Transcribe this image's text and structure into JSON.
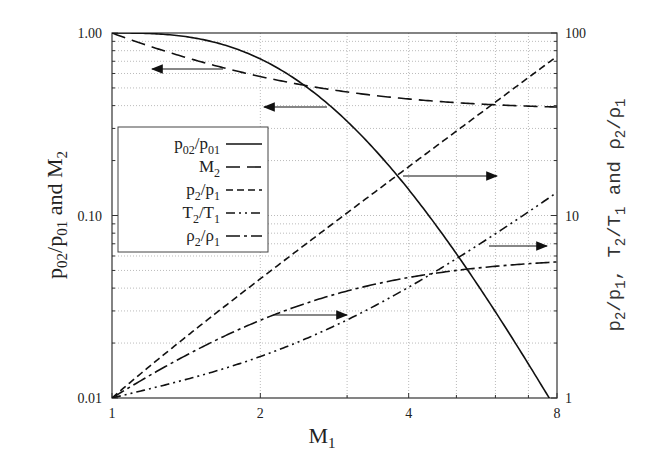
{
  "chart_data": {
    "type": "line",
    "title": "",
    "xlabel": "M_1",
    "ylabel_left": "p02/p01 and M2",
    "ylabel_right": "p2/p1, T2/T1 and ρ2/ρ1",
    "xscale": "log",
    "yscale_left": "log",
    "yscale_right": "log",
    "xlim": [
      1,
      8
    ],
    "ylim_left": [
      0.01,
      1.0
    ],
    "ylim_right": [
      1,
      100
    ],
    "x_ticks": [
      "1",
      "2",
      "4",
      "8"
    ],
    "y_ticks_left": [
      "0.01",
      "0.10",
      "1.00"
    ],
    "y_ticks_right": [
      "1",
      "10",
      "100"
    ],
    "grid": true,
    "legend_position": "upper-left",
    "x": [
      1,
      1.5,
      2,
      2.5,
      3,
      4,
      5,
      6,
      7,
      8
    ],
    "series": [
      {
        "name": "p02/p01",
        "axis": "left",
        "style": "solid",
        "values": [
          1.0,
          0.93,
          0.721,
          0.499,
          0.328,
          0.139,
          0.0617,
          0.0297,
          0.0154,
          0.0085
        ]
      },
      {
        "name": "M2",
        "axis": "left",
        "style": "long-dash",
        "values": [
          1.0,
          0.701,
          0.577,
          0.513,
          0.475,
          0.435,
          0.415,
          0.404,
          0.397,
          0.393
        ]
      },
      {
        "name": "p2/p1",
        "axis": "right",
        "style": "dash",
        "values": [
          1.0,
          2.458,
          4.5,
          7.125,
          10.33,
          18.5,
          29.0,
          41.83,
          57.0,
          74.5
        ]
      },
      {
        "name": "T2/T1",
        "axis": "right",
        "style": "dash-dot-dot",
        "values": [
          1.0,
          1.32,
          1.687,
          2.137,
          2.679,
          4.047,
          5.8,
          7.941,
          10.469,
          13.387
        ]
      },
      {
        "name": "ρ2/ρ1",
        "axis": "right",
        "style": "dash-dot",
        "values": [
          1.0,
          1.862,
          2.667,
          3.333,
          3.857,
          4.571,
          5.0,
          5.268,
          5.444,
          5.565
        ]
      }
    ],
    "annotations": [
      {
        "type": "arrow",
        "direction": "left",
        "meaning": "M2 reads left axis"
      },
      {
        "type": "arrow",
        "direction": "left",
        "meaning": "p02/p01 reads left axis"
      },
      {
        "type": "arrow",
        "direction": "right",
        "meaning": "p2/p1 reads right axis"
      },
      {
        "type": "arrow",
        "direction": "right",
        "meaning": "T2/T1 reads right axis"
      },
      {
        "type": "arrow",
        "direction": "right",
        "meaning": "ρ2/ρ1 reads right axis"
      }
    ]
  },
  "labels": {
    "x_axis": "M",
    "x_axis_sub": "1",
    "left_axis": "p02/p01 and M2",
    "right_axis": "p2/p1, T2/T1 and ρ2/ρ1"
  },
  "legend": [
    {
      "label": "p",
      "sub1": "02",
      "mid": "/p",
      "sub2": "01"
    },
    {
      "label": "M",
      "sub1": "2",
      "mid": "",
      "sub2": ""
    },
    {
      "label": "p",
      "sub1": "2",
      "mid": "/p",
      "sub2": "1"
    },
    {
      "label": "T",
      "sub1": "2",
      "mid": "/T",
      "sub2": "1"
    },
    {
      "label": "ρ",
      "sub1": "2",
      "mid": "/ρ",
      "sub2": "1"
    }
  ]
}
